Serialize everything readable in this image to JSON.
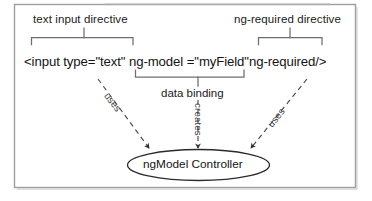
{
  "figure": {
    "frame": {
      "border_color": "#9a9a9a",
      "background": "#ffffff"
    },
    "annotations": {
      "left_directive_label": "text input directive",
      "right_directive_label": "ng-required directive",
      "data_binding_label": "data binding"
    },
    "code": {
      "full_line": "<input type=\"text\" ng-model =\"myField\"ng-required/>",
      "segment_left": "<input type=\"text\" ",
      "segment_model": "ng-model =\"myField\"",
      "segment_required": "ng-required/>"
    },
    "node": {
      "shape": "ellipse",
      "label": "ngModel Controller",
      "stroke": "#2b2b2b",
      "fill": "#ffffff"
    },
    "edges": [
      {
        "id": "edge-left",
        "label": "uses",
        "style": "dashed",
        "from": "text input directive",
        "to": "ngModel Controller"
      },
      {
        "id": "edge-middle",
        "label": "creates",
        "style": "dashed",
        "from": "data binding",
        "to": "ngModel Controller"
      },
      {
        "id": "edge-right",
        "label": "uses",
        "style": "dashed",
        "from": "ng-required directive",
        "to": "ngModel Controller"
      }
    ],
    "brackets": [
      {
        "id": "bracket-left",
        "spans": "text input directive"
      },
      {
        "id": "bracket-right",
        "spans": "ng-required directive"
      },
      {
        "id": "bracket-middle",
        "spans": "data binding"
      }
    ],
    "colors": {
      "ink": "#1a1a1a",
      "line": "#555555",
      "frame": "#9a9a9a"
    }
  }
}
